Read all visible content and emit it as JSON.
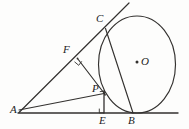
{
  "figure": {
    "kind": "plane-geometry-diagram",
    "stroke_color": "#33312f",
    "background_color": "#fdfdfc",
    "width": 189,
    "height": 129,
    "points": [
      {
        "id": "A",
        "label": "A",
        "x": 20,
        "y": 113,
        "label_x": 11,
        "label_y": 106
      },
      {
        "id": "C",
        "label": "C",
        "x": 105,
        "y": 29,
        "label_x": 97,
        "label_y": 15
      },
      {
        "id": "O",
        "label": "O",
        "x": 137,
        "y": 63,
        "label_x": 142,
        "label_y": 56
      },
      {
        "id": "F",
        "label": "F",
        "x": 77,
        "y": 58,
        "label_x": 63,
        "label_y": 47
      },
      {
        "id": "P",
        "label": "P",
        "x": 104,
        "y": 94,
        "label_x": 93,
        "label_y": 88
      },
      {
        "id": "E",
        "label": "E",
        "x": 104,
        "y": 113,
        "label_x": 100,
        "label_y": 117
      },
      {
        "id": "B",
        "label": "B",
        "x": 133,
        "y": 113,
        "label_x": 129,
        "label_y": 117
      }
    ],
    "circle": {
      "center_x": 137,
      "center_y": 64.5,
      "radius_x": 38.5,
      "radius_y": 48.5
    },
    "segments": [
      {
        "id": "AB-baseline",
        "from": "A",
        "to": "line-right-end",
        "x1": 18,
        "y1": 113,
        "x2": 178,
        "y2": 113
      },
      {
        "id": "AC-tangent",
        "from": "A",
        "to": "tangent-end",
        "x1": 19,
        "y1": 112,
        "x2": 129,
        "y2": 3
      },
      {
        "id": "CB-chord",
        "from": "C",
        "to": "B",
        "x1": 105,
        "y1": 29,
        "x2": 133,
        "y2": 113
      },
      {
        "id": "FP-segment",
        "from": "F",
        "to": "P",
        "x1": 77,
        "y1": 58,
        "x2": 105,
        "y2": 95
      },
      {
        "id": "PE-segment",
        "from": "P",
        "to": "E",
        "x1": 104,
        "y1": 92,
        "x2": 104,
        "y2": 113
      },
      {
        "id": "AP-segment",
        "from": "A",
        "to": "P",
        "x1": 19,
        "y1": 110,
        "x2": 104,
        "y2": 93
      }
    ],
    "right_angle_marks": [
      {
        "id": "angle-at-F",
        "x": 77,
        "y": 58,
        "note": "right angle between AC and FP"
      },
      {
        "id": "angle-at-P",
        "x": 104,
        "y": 92,
        "note": "right angle between PE and arc segment"
      },
      {
        "id": "angle-at-E",
        "x": 104,
        "y": 113,
        "note": "right angle between PE and AB"
      }
    ]
  }
}
